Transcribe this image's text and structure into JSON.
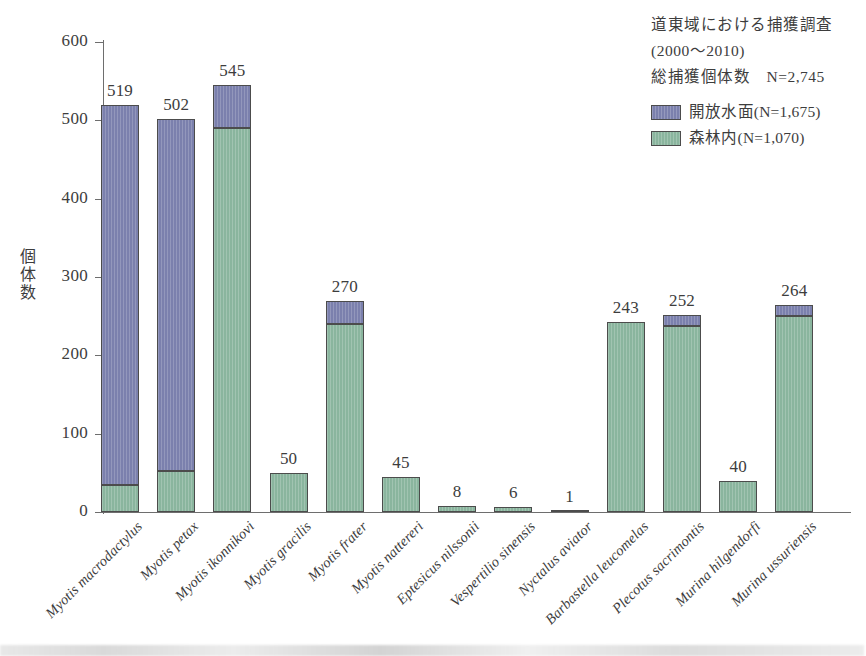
{
  "chart_data": {
    "type": "bar",
    "subtype": "stacked-bar",
    "title": "",
    "xlabel": "",
    "ylabel": "個体数",
    "ylim": [
      0,
      600
    ],
    "yticks": [
      0,
      100,
      200,
      300,
      400,
      500,
      600
    ],
    "grid": false,
    "legend_position": "top-right",
    "categories": [
      "Myotis macrodactylus",
      "Myotis petax",
      "Myotis ikonnikovi",
      "Myotis gracilis",
      "Myotis frater",
      "Myotis nattereri",
      "Eptesicus nilssonii",
      "Vespertilio sinensis",
      "Nyctalus aviator",
      "Barbastella leucomelas",
      "Plecotus sacrimontis",
      "Murina hilgendorfi",
      "Murina ussuriensis"
    ],
    "series": [
      {
        "name": "森林内(N=1,070)",
        "key": "forest",
        "color": "#8ab59e",
        "values": [
          35,
          52,
          490,
          50,
          240,
          45,
          8,
          6,
          1,
          243,
          238,
          40,
          250
        ]
      },
      {
        "name": "開放水面(N=1,675)",
        "key": "open_water",
        "color": "#7b80ad",
        "values": [
          484,
          450,
          55,
          0,
          30,
          0,
          0,
          0,
          0,
          0,
          14,
          0,
          14
        ]
      }
    ],
    "totals": [
      519,
      502,
      545,
      50,
      270,
      45,
      8,
      6,
      1,
      243,
      252,
      40,
      264
    ],
    "total_labels": [
      "519",
      "502",
      "545",
      "50",
      "270",
      "45",
      "8",
      "6",
      "1",
      "243",
      "252",
      "40",
      "264"
    ],
    "ytick_labels": [
      "0",
      "100",
      "200",
      "300",
      "400",
      "500",
      "600"
    ]
  },
  "annotation": {
    "line1": "道東域における捕獲調査",
    "line2": "(2000〜2010)",
    "line3": "総捕獲個体数　N=2,745"
  },
  "legend": {
    "items": [
      {
        "label": "開放水面(N=1,675)",
        "color": "#7b80ad",
        "swatch": "open-water-swatch"
      },
      {
        "label": "森林内(N=1,070)",
        "color": "#8ab59e",
        "swatch": "forest-swatch"
      }
    ]
  }
}
